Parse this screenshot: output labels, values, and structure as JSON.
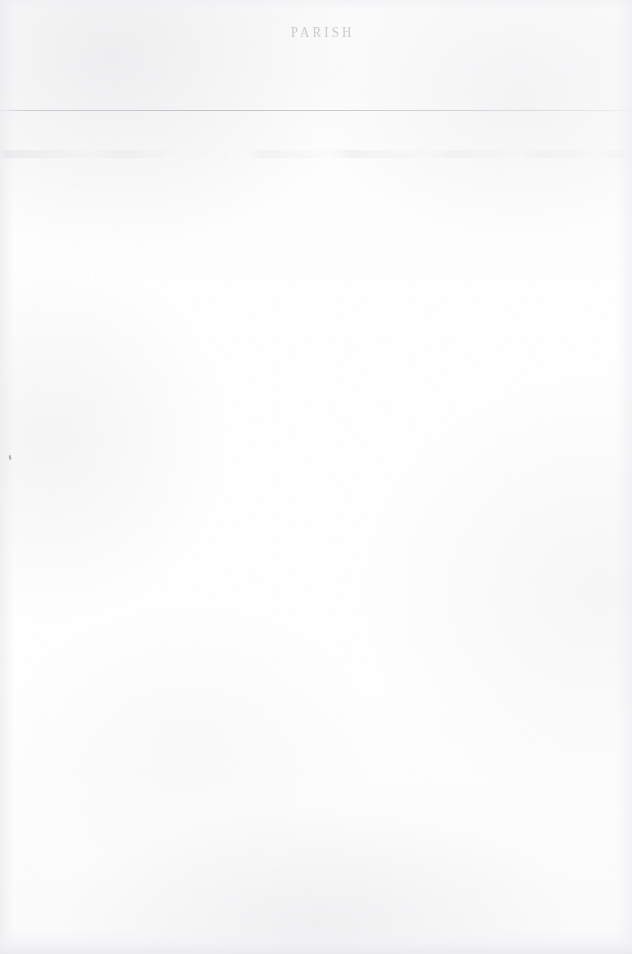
{
  "document": {
    "type": "scanned-page",
    "page_background_color": "#fdfdfd",
    "ink_color": "#b9b9bf",
    "header": {
      "visible": true,
      "legibility": "heavily-faded",
      "full_text": "PARISH",
      "words": [
        {
          "text": "",
          "legibility": "illegible"
        },
        {
          "text": "",
          "legibility": "illegible"
        },
        {
          "text": "PARISH",
          "legibility": "partially-legible"
        },
        {
          "text": "",
          "legibility": "illegible"
        }
      ]
    },
    "rules": [
      {
        "name": "top-rule",
        "y": 110,
        "color": "#c4c4ca"
      }
    ],
    "ghost_row": {
      "visible": true,
      "y": 150,
      "legibility": "illegible"
    },
    "artifacts": [
      {
        "name": "ink-speck",
        "x": 9,
        "y": 455
      }
    ],
    "body": {
      "content": "",
      "note": "blank"
    }
  }
}
